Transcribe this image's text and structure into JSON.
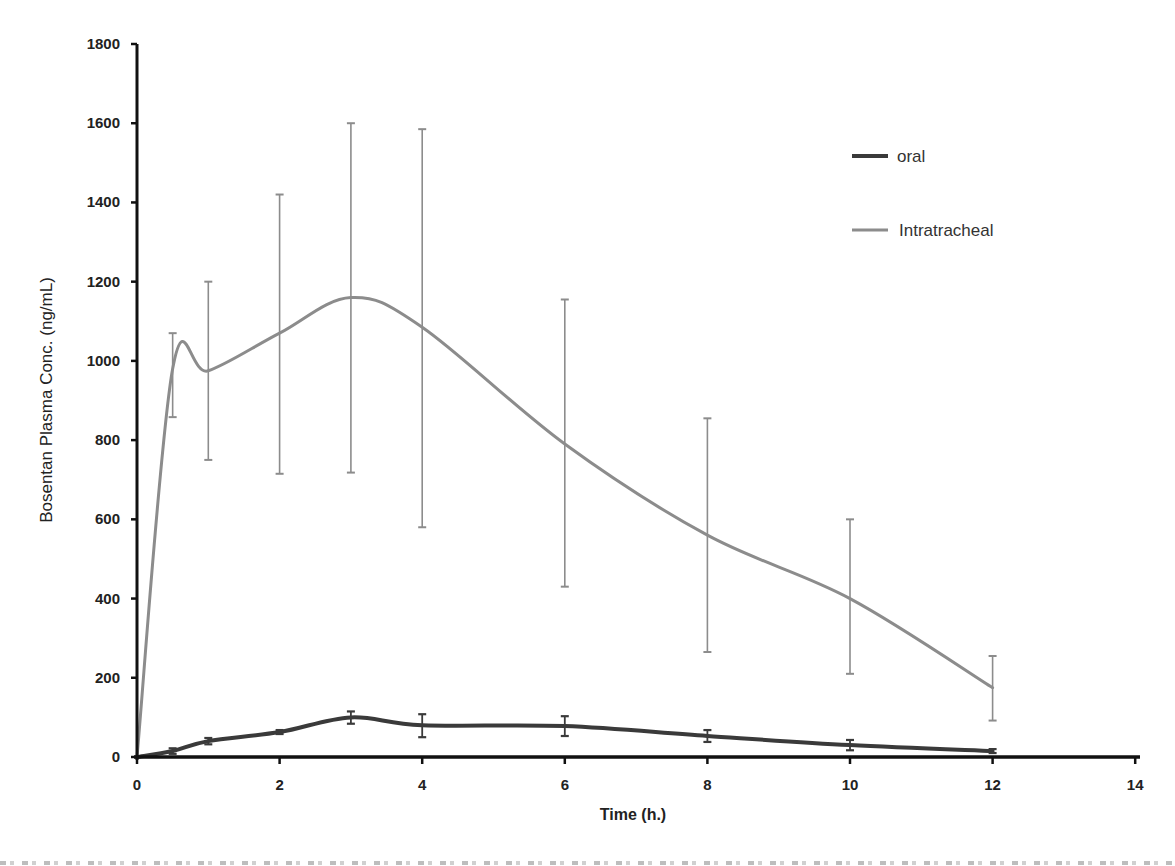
{
  "chart_data": {
    "type": "line",
    "title": "",
    "xlabel": "Time (h.)",
    "ylabel": "Bosentan Plasma Conc. (ng/mL)",
    "xlim": [
      0,
      14
    ],
    "ylim": [
      0,
      1800
    ],
    "x_ticks": [
      0,
      2,
      4,
      6,
      8,
      10,
      12,
      14
    ],
    "y_ticks": [
      0,
      200,
      400,
      600,
      800,
      1000,
      1200,
      1400,
      1600,
      1800
    ],
    "grid": false,
    "legend_position": "upper right",
    "smooth": true,
    "series": [
      {
        "name": "oral",
        "color": "#3a3a3a",
        "line_width": 4,
        "x": [
          0,
          0.5,
          1,
          2,
          3,
          4,
          6,
          8,
          10,
          12
        ],
        "values": [
          0,
          15,
          40,
          63,
          100,
          80,
          78,
          53,
          30,
          15
        ],
        "error_upper": [
          0,
          22,
          48,
          68,
          115,
          108,
          103,
          68,
          43,
          20
        ],
        "error_lower": [
          0,
          8,
          32,
          58,
          84,
          50,
          53,
          38,
          17,
          10
        ]
      },
      {
        "name": "Intratracheal",
        "color": "#8c8c8c",
        "line_width": 3,
        "x": [
          0,
          0.5,
          1,
          2,
          3,
          4,
          6,
          8,
          10,
          12
        ],
        "values": [
          0,
          980,
          975,
          1070,
          1160,
          1085,
          790,
          560,
          400,
          175
        ],
        "error_upper": [
          0,
          1070,
          1200,
          1420,
          1600,
          1585,
          1155,
          855,
          600,
          255
        ],
        "error_lower": [
          0,
          858,
          750,
          715,
          718,
          580,
          430,
          265,
          210,
          92
        ]
      }
    ]
  },
  "axes": {
    "x_title": "Time (h.)",
    "y_title": "Bosentan Plasma Conc. (ng/mL)"
  },
  "legend": {
    "items": [
      {
        "label": "oral",
        "color": "#3a3a3a"
      },
      {
        "label": "Intratracheal",
        "color": "#8c8c8c"
      }
    ]
  }
}
